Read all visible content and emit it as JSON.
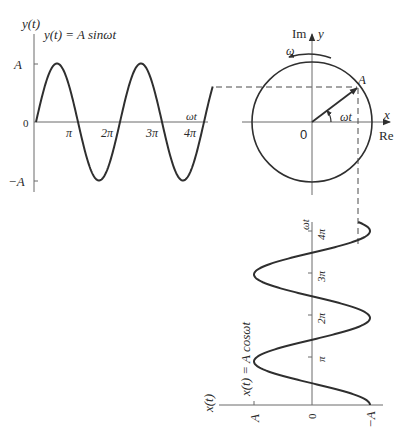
{
  "colors": {
    "stroke": "#2f2f2f",
    "axis": "#6a6a6a",
    "text": "#2a2a2a",
    "background": "#ffffff"
  },
  "sine_plot": {
    "y_axis_label": "y(t)",
    "equation": "y(t) = A sinωt",
    "y_ticks": [
      "A",
      "0",
      "−A"
    ],
    "x_ticks": [
      "π",
      "2π",
      "3π",
      "4π"
    ],
    "x_axis_label": "ωt"
  },
  "phasor": {
    "imag_axis_label": "Im",
    "y_label": "y",
    "real_axis_label": "Re",
    "x_label": "x",
    "origin_label": "0",
    "rotation_label": "ω",
    "point_label": "A",
    "angle_label": "ωt"
  },
  "cosine_plot": {
    "x_axis_label": "x(t)",
    "equation": "x(t) = A cosωt",
    "amplitude_ticks": [
      "A",
      "0",
      "−A"
    ],
    "time_ticks": [
      "π",
      "2π",
      "3π",
      "4π"
    ],
    "time_axis_label": "ωt"
  }
}
